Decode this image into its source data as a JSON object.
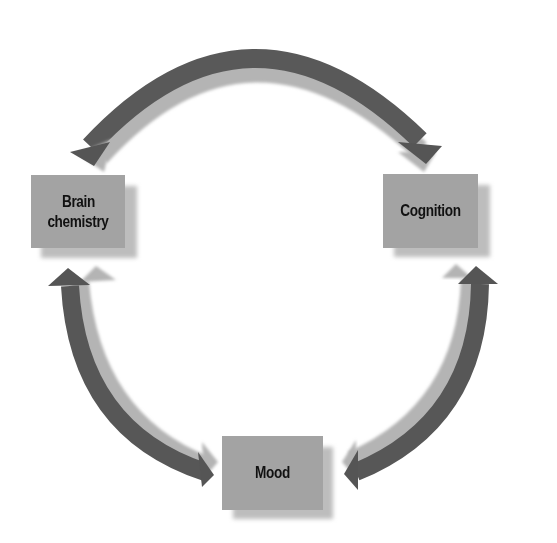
{
  "diagram": {
    "type": "cycle",
    "nodes": [
      {
        "id": "brain-chemistry",
        "label_line1": "Brain",
        "label_line2": "chemistry"
      },
      {
        "id": "cognition",
        "label": "Cognition"
      },
      {
        "id": "mood",
        "label": "Mood"
      }
    ],
    "edges": [
      {
        "from": "brain-chemistry",
        "to": "cognition",
        "bidirectional": true,
        "position": "top"
      },
      {
        "from": "brain-chemistry",
        "to": "mood",
        "bidirectional": true,
        "position": "left"
      },
      {
        "from": "cognition",
        "to": "mood",
        "bidirectional": true,
        "position": "right"
      }
    ],
    "colors": {
      "box_fill": "#a3a3a3",
      "box_shadow": "#bdbdbd",
      "arrow_dark": "#555555",
      "arrow_light": "#a8a8a8",
      "text": "#111111",
      "background": "#ffffff"
    }
  }
}
